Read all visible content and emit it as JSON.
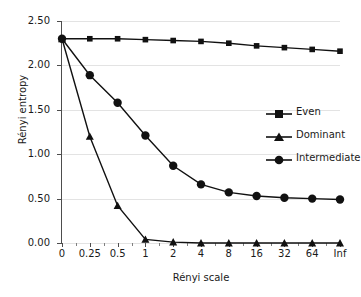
{
  "chart_data": {
    "type": "line",
    "title": "",
    "xlabel": "Rényi scale",
    "ylabel": "Rényi entropy",
    "categories": [
      "0",
      "0.25",
      "0.5",
      "1",
      "2",
      "4",
      "8",
      "16",
      "32",
      "64",
      "Inf"
    ],
    "ylim": [
      0.0,
      2.5
    ],
    "yticks": [
      "0.00",
      "0.50",
      "1.00",
      "1.50",
      "2.00",
      "2.50"
    ],
    "ytick_values": [
      0.0,
      0.5,
      1.0,
      1.5,
      2.0,
      2.5
    ],
    "grid": "horizontal",
    "legend_position": "right-inside",
    "series": [
      {
        "name": "Even",
        "marker": "square",
        "color": "#111111",
        "values": [
          2.3,
          2.3,
          2.3,
          2.29,
          2.28,
          2.27,
          2.25,
          2.22,
          2.2,
          2.18,
          2.16
        ]
      },
      {
        "name": "Dominant",
        "marker": "triangle",
        "color": "#111111",
        "values": [
          2.3,
          1.2,
          0.42,
          0.04,
          0.01,
          0.0,
          0.0,
          0.0,
          0.0,
          0.0,
          0.0
        ]
      },
      {
        "name": "Intermediate",
        "marker": "circle",
        "color": "#111111",
        "values": [
          2.3,
          1.89,
          1.58,
          1.21,
          0.87,
          0.66,
          0.57,
          0.53,
          0.51,
          0.5,
          0.49
        ]
      }
    ]
  },
  "axes": {
    "y_title": "Rényi entropy",
    "x_title": "Rényi scale"
  },
  "legend": {
    "items": [
      {
        "label": "Even",
        "marker": "square-marker-icon"
      },
      {
        "label": "Dominant",
        "marker": "triangle-marker-icon"
      },
      {
        "label": "Intermediate",
        "marker": "circle-marker-icon"
      }
    ]
  }
}
